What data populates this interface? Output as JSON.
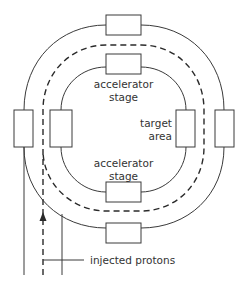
{
  "diagram": {
    "labels": {
      "top_stage_line1": "accelerator",
      "top_stage_line2": "stage",
      "bottom_stage_line1": "accelerator",
      "bottom_stage_line2": "stage",
      "target_line1": "target",
      "target_line2": "area",
      "injected": "injected protons"
    },
    "colors": {
      "line": "#3a3a3a",
      "text": "#333333",
      "background": "#ffffff"
    }
  }
}
